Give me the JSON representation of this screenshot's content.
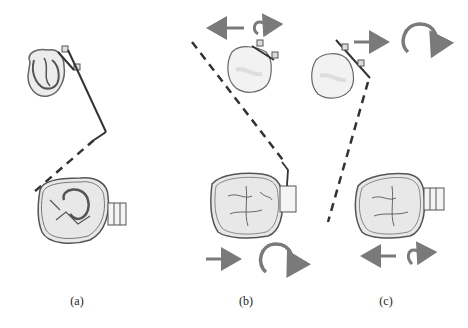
{
  "figure": {
    "panels": [
      {
        "id": "a",
        "label": "(a)"
      },
      {
        "id": "b",
        "label": "(b)"
      },
      {
        "id": "c",
        "label": "(c)"
      }
    ],
    "colors": {
      "arrow": "#7a7a7a",
      "stroke": "#555555",
      "dash": "#333333",
      "fill": "#e8e8e8"
    }
  }
}
